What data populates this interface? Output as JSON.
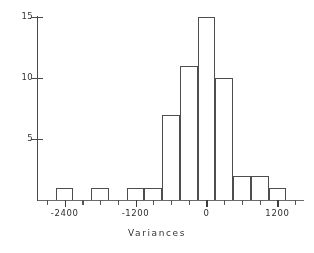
{
  "chart_data": {
    "type": "bar",
    "title": "",
    "subtitle": "",
    "xlabel": "Variances",
    "ylabel": "",
    "style": "histogram",
    "bar_fill": "#ffffff",
    "bar_edge_color": "#4e4e4e",
    "axis_color": "#4a4a4a",
    "grid": false,
    "legend": null,
    "bin_width": 300,
    "xlim": [
      -2850,
      1650
    ],
    "ylim": [
      0,
      15
    ],
    "x_tick_labels": [
      "-2400",
      "-1200",
      "0",
      "1200"
    ],
    "x_tick_values": [
      -2400,
      -1200,
      0,
      1200
    ],
    "x_minor_tick_values": [
      -2700,
      -2400,
      -2100,
      -1800,
      -1500,
      -1200,
      -900,
      -600,
      -300,
      0,
      300,
      600,
      900,
      1200,
      1500
    ],
    "y_tick_labels": [
      "5",
      "10",
      "15"
    ],
    "y_tick_values": [
      5,
      10,
      15
    ],
    "categories": [
      "-2850 to -2550",
      "-2550 to -2250",
      "-2250 to -1950",
      "-1950 to -1650",
      "-1650 to -1350",
      "-1350 to -1050",
      "-1050 to -750",
      "-750 to -450",
      "-450 to -150",
      "-150 to 150",
      "150 to 450",
      "450 to 750",
      "750 to 1050",
      "1050 to 1350"
    ],
    "bin_left_edges": [
      -2850,
      -2550,
      -2250,
      -1950,
      -1650,
      -1350,
      -1050,
      -750,
      -450,
      -150,
      150,
      450,
      750,
      1050
    ],
    "values": [
      0,
      1,
      0,
      1,
      0,
      1,
      1,
      7,
      11,
      15,
      10,
      2,
      2,
      1
    ]
  },
  "axes": {
    "x_title": "Variances"
  }
}
